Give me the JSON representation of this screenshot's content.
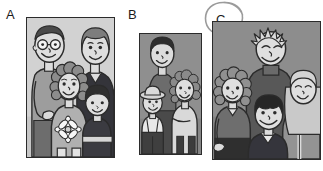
{
  "page": {
    "background_color": "#ffffff",
    "width": 323,
    "height": 171
  },
  "options": [
    {
      "id": "a",
      "letter": "A",
      "circled": false,
      "photo": {
        "name": "family-photo-a",
        "people_count": 4,
        "frame_color": "#2b2b2b",
        "background_color": "#cfcfcf",
        "people": [
          {
            "role": "father",
            "hair": "short",
            "glasses": true,
            "shirt_color": "#9a9a9a",
            "position": "back-left"
          },
          {
            "role": "mother",
            "hair": "bob",
            "glasses": false,
            "shirt_color": "#2f2f33",
            "position": "back-right"
          },
          {
            "role": "daughter",
            "hair": "curly",
            "glasses": false,
            "shirt_color": "#a9a9a9",
            "position": "front-centre",
            "motif": "daisy-flower"
          },
          {
            "role": "son",
            "hair": "bowl",
            "glasses": false,
            "shirt_color": "#3a3a3f",
            "position": "front-right"
          }
        ]
      }
    },
    {
      "id": "b",
      "letter": "B",
      "circled": false,
      "photo": {
        "name": "family-photo-b",
        "people_count": 3,
        "frame_color": "#2b2b2b",
        "background_color": "#8e8e8e",
        "people": [
          {
            "role": "father",
            "hair": "short dark",
            "glasses": false,
            "shirt_color": "#6a6a6a",
            "position": "back-centre"
          },
          {
            "role": "son",
            "hair": "hat",
            "glasses": false,
            "shirt_color": "#e8e8e8",
            "position": "front-left"
          },
          {
            "role": "daughter",
            "hair": "curly",
            "glasses": false,
            "shirt_color": "#d8d8d8",
            "position": "front-right"
          }
        ]
      }
    },
    {
      "id": "c",
      "letter": "C",
      "circled": true,
      "photo": {
        "name": "family-photo-c",
        "people_count": 4,
        "frame_color": "#2b2b2b",
        "background_color": "#8a8a8a",
        "people": [
          {
            "role": "father",
            "hair": "spiky light",
            "glasses": false,
            "shirt_color": "#5a5a5a",
            "position": "back-centre"
          },
          {
            "role": "daughter-left",
            "hair": "curly",
            "glasses": false,
            "shirt_color": "#6f6f6f",
            "position": "middle-left"
          },
          {
            "role": "son",
            "hair": "dark mop",
            "glasses": false,
            "shirt_color": "#33333a",
            "position": "front-centre"
          },
          {
            "role": "mother",
            "hair": "long light",
            "glasses": false,
            "shirt_color": "#8f8f8f",
            "position": "middle-right"
          }
        ]
      }
    }
  ],
  "marks": {
    "selection_circle": {
      "name": "hand-drawn-circle",
      "target_letter": "C",
      "stroke_color": "#9a9a9a"
    }
  }
}
